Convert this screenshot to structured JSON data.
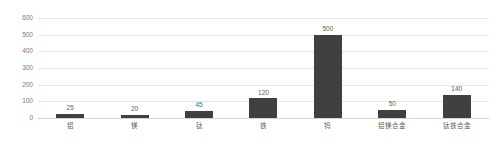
{
  "chart_data": {
    "type": "bar",
    "title": "",
    "subtitle": "",
    "xlabel": "",
    "ylabel": "",
    "categories": [
      "铝",
      "镁",
      "钛",
      "铁",
      "钨",
      "铝镁合金",
      "钛铁合金"
    ],
    "values": [
      25,
      20,
      45,
      120,
      500,
      50,
      140
    ],
    "value_labels": [
      "25",
      "20",
      "45",
      "120",
      "500",
      "50",
      "140"
    ],
    "ylim": [
      0,
      600
    ],
    "yticks": [
      0,
      100,
      200,
      300,
      400,
      500,
      600
    ],
    "ytick_labels": [
      "0",
      "100",
      "200",
      "300",
      "400",
      "500",
      "600"
    ],
    "grid": true,
    "grid_axis": "y",
    "legend": false,
    "legend_position": "none",
    "series": [
      {
        "name": "",
        "values": [
          25,
          20,
          45,
          120,
          500,
          50,
          140
        ],
        "color": "#404040"
      }
    ],
    "colors": {
      "bar": "#404040",
      "gridline": "#e8e8e8",
      "baseline": "#d4d4d4",
      "tick_text": "#7b7b7b",
      "label_text": "#5e5e5e",
      "background": "#ffffff"
    }
  }
}
